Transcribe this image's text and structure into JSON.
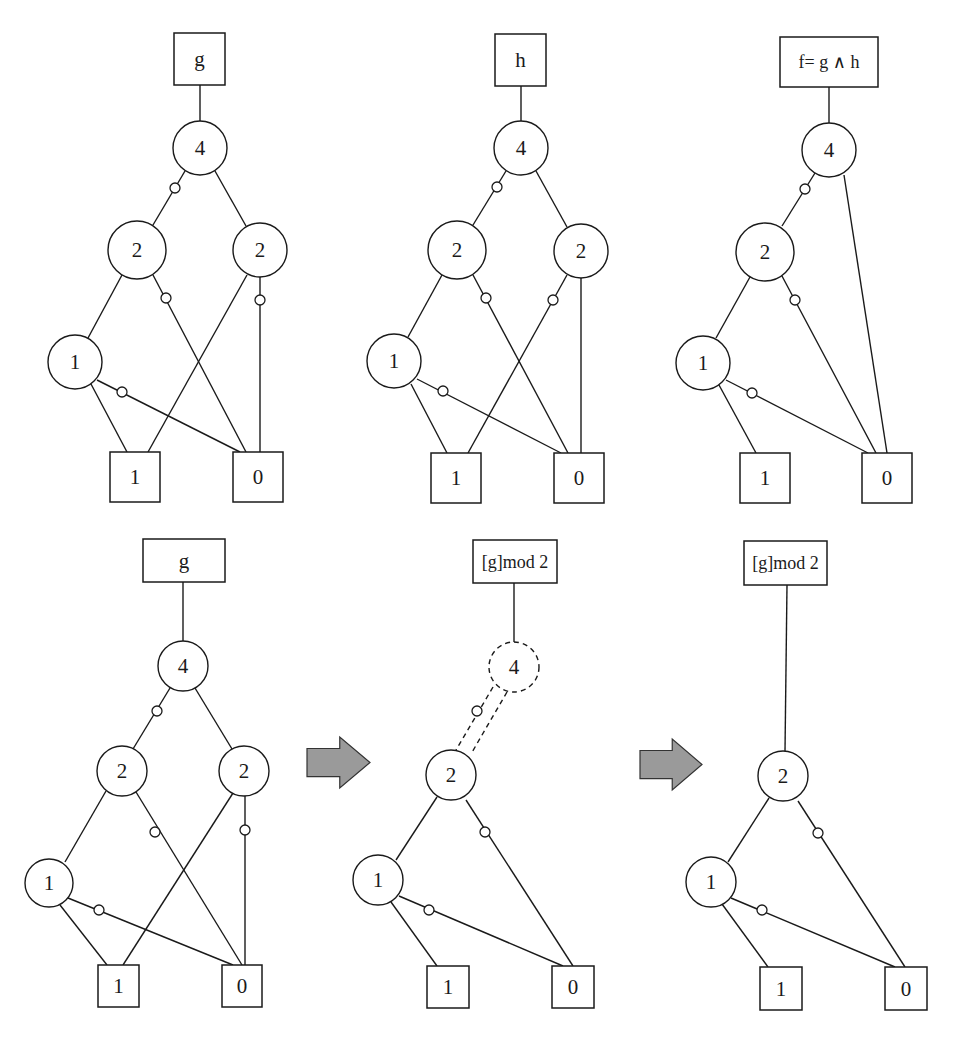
{
  "figure": {
    "colors": {
      "line": "#1a1a1a",
      "arrow_fill": "#9a9a9a",
      "background": "#ffffff"
    },
    "panels": [
      {
        "id": "top-g",
        "root": {
          "label": "g",
          "x": 174,
          "y": 33,
          "w": 51,
          "h": 52
        },
        "nodes": [
          {
            "id": "n4",
            "label": "4",
            "cx": 200,
            "cy": 148,
            "r": 27
          },
          {
            "id": "n2a",
            "label": "2",
            "cx": 137,
            "cy": 250,
            "r": 29
          },
          {
            "id": "n2b",
            "label": "2",
            "cx": 260,
            "cy": 250,
            "r": 27
          },
          {
            "id": "n1",
            "label": "1",
            "cx": 75,
            "cy": 362,
            "r": 27
          }
        ],
        "terminals": [
          {
            "id": "t1",
            "label": "1",
            "x": 110,
            "y": 452,
            "w": 50,
            "h": 50
          },
          {
            "id": "t0",
            "label": "0",
            "x": 233,
            "y": 452,
            "w": 50,
            "h": 50
          }
        ],
        "edges": [
          {
            "x1": 200,
            "y1": 85,
            "x2": 200,
            "y2": 121
          },
          {
            "x1": 185,
            "y1": 171,
            "x2": 153,
            "y2": 225,
            "dot": [
              175,
              188
            ]
          },
          {
            "x1": 215,
            "y1": 171,
            "x2": 246,
            "y2": 226
          },
          {
            "x1": 122,
            "y1": 275,
            "x2": 88,
            "y2": 338
          },
          {
            "x1": 153,
            "y1": 275,
            "x2": 246,
            "y2": 452,
            "dot": [
              166,
              298
            ]
          },
          {
            "x1": 247,
            "y1": 275,
            "x2": 148,
            "y2": 452
          },
          {
            "x1": 260,
            "y1": 277,
            "x2": 260,
            "y2": 452,
            "dot": [
              260,
              300
            ]
          },
          {
            "x1": 91,
            "y1": 384,
            "x2": 127,
            "y2": 452
          },
          {
            "x1": 97,
            "y1": 380,
            "x2": 240,
            "y2": 452,
            "dot": [
              122,
              392
            ]
          }
        ]
      },
      {
        "id": "top-h",
        "root": {
          "label": "h",
          "x": 495,
          "y": 34,
          "w": 51,
          "h": 52
        },
        "nodes": [
          {
            "id": "n4",
            "label": "4",
            "cx": 521,
            "cy": 148,
            "r": 27
          },
          {
            "id": "n2a",
            "label": "2",
            "cx": 457,
            "cy": 250,
            "r": 29
          },
          {
            "id": "n2b",
            "label": "2",
            "cx": 581,
            "cy": 251,
            "r": 27
          }
        ],
        "extra_nodes": [
          {
            "id": "n1",
            "label": "1",
            "cx": 394,
            "cy": 361,
            "r": 27
          }
        ],
        "terminals": [
          {
            "id": "t1",
            "label": "1",
            "x": 431,
            "y": 453,
            "w": 50,
            "h": 50
          },
          {
            "id": "t0",
            "label": "0",
            "x": 554,
            "y": 453,
            "w": 50,
            "h": 50
          }
        ],
        "edges": [
          {
            "x1": 521,
            "y1": 86,
            "x2": 521,
            "y2": 121
          },
          {
            "x1": 506,
            "y1": 171,
            "x2": 473,
            "y2": 225,
            "dot": [
              497,
              187
            ]
          },
          {
            "x1": 536,
            "y1": 171,
            "x2": 567,
            "y2": 227
          },
          {
            "x1": 442,
            "y1": 275,
            "x2": 408,
            "y2": 337
          },
          {
            "x1": 473,
            "y1": 275,
            "x2": 568,
            "y2": 453,
            "dot": [
              486,
              298
            ]
          },
          {
            "x1": 567,
            "y1": 275,
            "x2": 468,
            "y2": 453,
            "dot": [
              553,
              300
            ]
          },
          {
            "x1": 581,
            "y1": 278,
            "x2": 581,
            "y2": 453
          },
          {
            "x1": 411,
            "y1": 384,
            "x2": 447,
            "y2": 453
          },
          {
            "x1": 417,
            "y1": 379,
            "x2": 561,
            "y2": 453,
            "dot": [
              443,
              391
            ]
          }
        ]
      },
      {
        "id": "top-f",
        "root": {
          "label": "f= g ∧ h",
          "x": 780,
          "y": 37,
          "w": 98,
          "h": 50
        },
        "nodes": [
          {
            "id": "n4",
            "label": "4",
            "cx": 829,
            "cy": 150,
            "r": 27
          },
          {
            "id": "n2",
            "label": "2",
            "cx": 765,
            "cy": 252,
            "r": 29
          },
          {
            "id": "n1",
            "label": "1",
            "cx": 703,
            "cy": 363,
            "r": 27
          }
        ],
        "terminals": [
          {
            "id": "t1",
            "label": "1",
            "x": 740,
            "y": 453,
            "w": 50,
            "h": 50
          },
          {
            "id": "t0",
            "label": "0",
            "x": 862,
            "y": 453,
            "w": 50,
            "h": 50
          }
        ],
        "edges": [
          {
            "x1": 829,
            "y1": 87,
            "x2": 829,
            "y2": 123
          },
          {
            "x1": 815,
            "y1": 173,
            "x2": 782,
            "y2": 226,
            "dot": [
              805,
              189
            ]
          },
          {
            "x1": 844,
            "y1": 175,
            "x2": 887,
            "y2": 453
          },
          {
            "x1": 750,
            "y1": 277,
            "x2": 716,
            "y2": 338
          },
          {
            "x1": 782,
            "y1": 276,
            "x2": 876,
            "y2": 453,
            "dot": [
              795,
              300
            ]
          },
          {
            "x1": 719,
            "y1": 385,
            "x2": 756,
            "y2": 453
          },
          {
            "x1": 726,
            "y1": 380,
            "x2": 868,
            "y2": 453,
            "dot": [
              752,
              393
            ]
          }
        ]
      },
      {
        "id": "bottom-g",
        "root": {
          "label": "g",
          "x": 143,
          "y": 539,
          "w": 82,
          "h": 43
        },
        "nodes": [
          {
            "id": "n4",
            "label": "4",
            "cx": 183,
            "cy": 666,
            "r": 25
          },
          {
            "id": "n2a",
            "label": "2",
            "cx": 122,
            "cy": 771,
            "r": 25
          },
          {
            "id": "n2b",
            "label": "2",
            "cx": 244,
            "cy": 771,
            "r": 25
          },
          {
            "id": "n1",
            "label": "1",
            "cx": 49,
            "cy": 883,
            "r": 24
          }
        ],
        "terminals": [
          {
            "id": "t1",
            "label": "1",
            "x": 98,
            "y": 965,
            "w": 41,
            "h": 42
          },
          {
            "id": "t0",
            "label": "0",
            "x": 222,
            "y": 965,
            "w": 40,
            "h": 42
          }
        ],
        "edges": [
          {
            "x1": 183,
            "y1": 582,
            "x2": 183,
            "y2": 641
          },
          {
            "x1": 170,
            "y1": 688,
            "x2": 133,
            "y2": 749,
            "dot": [
              157,
              711
            ]
          },
          {
            "x1": 195,
            "y1": 688,
            "x2": 232,
            "y2": 749
          },
          {
            "x1": 106,
            "y1": 791,
            "x2": 65,
            "y2": 862
          },
          {
            "x1": 136,
            "y1": 792,
            "x2": 242,
            "y2": 965,
            "dot": [
              155,
              832
            ]
          },
          {
            "x1": 233,
            "y1": 793,
            "x2": 123,
            "y2": 965
          },
          {
            "x1": 245,
            "y1": 796,
            "x2": 245,
            "y2": 965,
            "dot": [
              245,
              830
            ]
          },
          {
            "x1": 60,
            "y1": 905,
            "x2": 107,
            "y2": 965
          },
          {
            "x1": 68,
            "y1": 898,
            "x2": 233,
            "y2": 965,
            "dot": [
              99,
              910
            ]
          }
        ]
      },
      {
        "id": "bottom-mod-step1",
        "root": {
          "label": "[g]mod 2",
          "x": 473,
          "y": 540,
          "w": 84,
          "h": 43
        },
        "nodes": [
          {
            "id": "n4",
            "label": "4",
            "cx": 514,
            "cy": 667,
            "r": 25,
            "dashed": true
          },
          {
            "id": "n2",
            "label": "2",
            "cx": 451,
            "cy": 775,
            "r": 25
          },
          {
            "id": "n1",
            "label": "1",
            "cx": 378,
            "cy": 880,
            "r": 25
          }
        ],
        "terminals": [
          {
            "id": "t1",
            "label": "1",
            "x": 427,
            "y": 966,
            "w": 42,
            "h": 42
          },
          {
            "id": "t0",
            "label": "0",
            "x": 552,
            "y": 966,
            "w": 42,
            "h": 42
          }
        ],
        "edges": [
          {
            "x1": 514,
            "y1": 583,
            "x2": 514,
            "y2": 642
          },
          {
            "x1": 493,
            "y1": 687,
            "x2": 456,
            "y2": 750,
            "dot": [
              477,
              711
            ],
            "dashed": true
          },
          {
            "x1": 507,
            "y1": 692,
            "x2": 471,
            "y2": 754,
            "dashed": true
          },
          {
            "x1": 437,
            "y1": 797,
            "x2": 396,
            "y2": 860
          },
          {
            "x1": 466,
            "y1": 800,
            "x2": 573,
            "y2": 966,
            "dot": [
              485,
              832
            ]
          },
          {
            "x1": 391,
            "y1": 902,
            "x2": 437,
            "y2": 966
          },
          {
            "x1": 399,
            "y1": 896,
            "x2": 563,
            "y2": 966,
            "dot": [
              429,
              910
            ]
          }
        ]
      },
      {
        "id": "bottom-mod-step2",
        "root": {
          "label": "[g]mod 2",
          "x": 744,
          "y": 541,
          "w": 83,
          "h": 44
        },
        "nodes": [
          {
            "id": "n2",
            "label": "2",
            "cx": 783,
            "cy": 776,
            "r": 25
          },
          {
            "id": "n1",
            "label": "1",
            "cx": 711,
            "cy": 882,
            "r": 25
          }
        ],
        "terminals": [
          {
            "id": "t1",
            "label": "1",
            "x": 760,
            "y": 967,
            "w": 42,
            "h": 43
          },
          {
            "id": "t0",
            "label": "0",
            "x": 885,
            "y": 967,
            "w": 42,
            "h": 43
          }
        ],
        "edges": [
          {
            "x1": 787,
            "y1": 585,
            "x2": 785,
            "y2": 751
          },
          {
            "x1": 769,
            "y1": 798,
            "x2": 728,
            "y2": 862
          },
          {
            "x1": 798,
            "y1": 801,
            "x2": 905,
            "y2": 967,
            "dot": [
              818,
              833
            ]
          },
          {
            "x1": 722,
            "y1": 904,
            "x2": 768,
            "y2": 967
          },
          {
            "x1": 731,
            "y1": 898,
            "x2": 895,
            "y2": 967,
            "dot": [
              762,
              910
            ]
          }
        ]
      }
    ],
    "arrows": [
      {
        "id": "arrow-1",
        "x": 307,
        "y": 737,
        "w": 63,
        "h": 51
      },
      {
        "id": "arrow-2",
        "x": 640,
        "y": 739,
        "w": 62,
        "h": 51
      }
    ]
  }
}
